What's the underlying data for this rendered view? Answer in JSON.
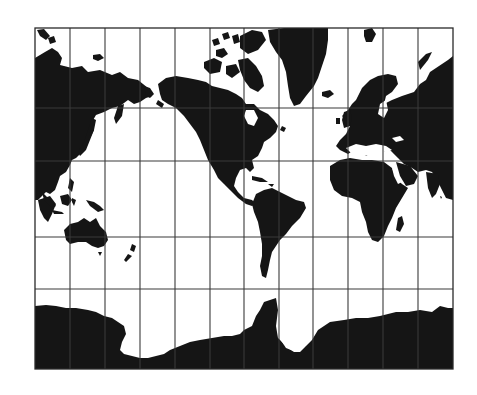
{
  "map": {
    "projection": "Mercator",
    "title": "",
    "colors": {
      "land": "#151515",
      "water": "#ffffff",
      "grid": "#3a3a3a"
    },
    "frame": {
      "left": 35,
      "top": 28,
      "right": 453,
      "bottom": 369
    },
    "graticule": {
      "verticals": [
        70,
        105,
        140,
        175,
        210,
        244,
        279,
        313,
        348,
        383,
        418
      ],
      "horizontals": [
        108,
        161,
        237,
        289
      ]
    },
    "features": [
      "eurasia",
      "greenland",
      "north-america",
      "south-america",
      "africa",
      "australia",
      "new-zealand",
      "antarctica",
      "indonesia",
      "japan",
      "british-isles",
      "madagascar",
      "canadian-arctic-islands",
      "svalbard",
      "iceland"
    ]
  }
}
